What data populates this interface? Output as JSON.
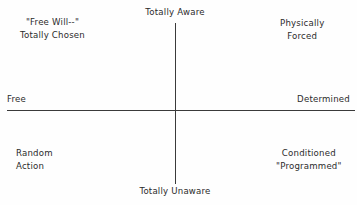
{
  "diagram": {
    "type": "quadrant",
    "axes": {
      "vertical": {
        "top_label": "Totally Aware",
        "bottom_label": "Totally Unaware"
      },
      "horizontal": {
        "left_label": "Free",
        "right_label": "Determined"
      }
    },
    "quadrants": {
      "top_left": {
        "line1": "\"Free Will--\"",
        "line2": "Totally Chosen"
      },
      "top_right": {
        "line1": "Physically",
        "line2": "Forced"
      },
      "bottom_left": {
        "line1": "Random",
        "line2": "Action"
      },
      "bottom_right": {
        "line1": "Conditioned",
        "line2": "\"Programmed\""
      }
    },
    "colors": {
      "background": "#fefefe",
      "line": "#3a3a3a",
      "text": "#2b2b2b"
    }
  }
}
